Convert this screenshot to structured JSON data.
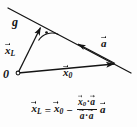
{
  "figure": {
    "title_text": "",
    "background_color": "#fdfdfd",
    "stroke_color": "#141414",
    "labels": {
      "line_g": "g",
      "vector_xL_symbol": "x",
      "vector_xL_subscript": "L",
      "vector_a_symbol": "a",
      "vector_x0_symbol": "x",
      "vector_x0_subscript": "0",
      "origin": "0"
    }
  },
  "equation": {
    "lhs_symbol": "x",
    "lhs_subscript": "L",
    "equals": "=",
    "term1_symbol": "x",
    "term1_subscript": "0",
    "minus": "−",
    "numerator_symbol1": "x",
    "numerator_subscript1": "0",
    "numerator_dot": "·",
    "numerator_symbol2": "a",
    "denominator_symbol1": "a",
    "denominator_dot": "·",
    "denominator_symbol2": "a",
    "trailing_symbol": "a",
    "plain_text": "x_L = x_0 - ((x_0 . a)/(a . a)) a"
  },
  "geometry": {
    "line_g": {
      "x1": 8,
      "y1": 8,
      "x2": 131,
      "y2": 73
    },
    "vector_xL": {
      "x1": 18,
      "y1": 73,
      "x2": 40,
      "y2": 26
    },
    "vector_x0": {
      "x1": 18,
      "y1": 73,
      "x2": 115,
      "y2": 64
    },
    "vector_a": {
      "x1": 112,
      "y1": 62,
      "x2": 77,
      "y2": 44
    },
    "right_angle_marker": "arc-with-dot",
    "origin_marker": "small-open-circle"
  }
}
